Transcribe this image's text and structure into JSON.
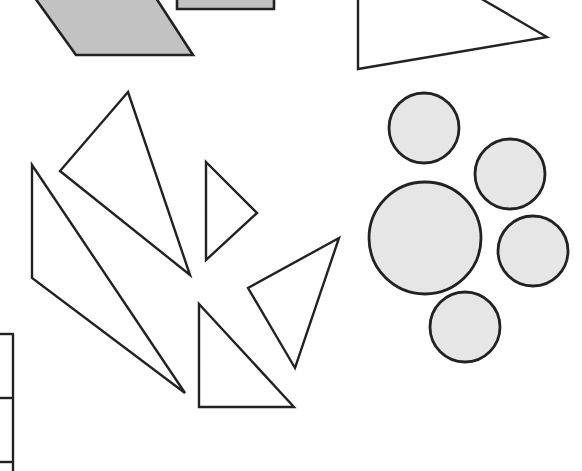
{
  "figure": {
    "colors": {
      "stroke": "#222222",
      "quad_fill": "#c2c2c2",
      "circle_fill": "#e6e6e6",
      "triangle_fill": "#ffffff",
      "background": "#ffffff"
    },
    "quadrilaterals": [
      {
        "name": "parallelogram",
        "points": "35,-2 156,-2 193,55 76,55",
        "fill": "#c2c2c2"
      },
      {
        "name": "rectangle",
        "points": "177,-2 274,-2 274,9 177,9",
        "fill": "#c2c2c2"
      }
    ],
    "triangles": [
      {
        "name": "triangle-top-right",
        "points": "358,-2 480,-2 547,37 358,69"
      },
      {
        "name": "triangle-tall-center",
        "points": "128,92 60,171 190,275"
      },
      {
        "name": "triangle-long-left",
        "points": "32,165 32,278 185,393"
      },
      {
        "name": "triangle-small-right-pointing",
        "points": "206,162 257,213 206,260"
      },
      {
        "name": "triangle-tilted",
        "points": "339,238 248,288 295,368"
      },
      {
        "name": "triangle-right-angle",
        "points": "199,304 199,407 294,407"
      }
    ],
    "circles": [
      {
        "name": "circle-top",
        "cx": 424,
        "cy": 128,
        "r": 35
      },
      {
        "name": "circle-upper-right",
        "cx": 510,
        "cy": 174,
        "r": 35
      },
      {
        "name": "circle-large",
        "cx": 425,
        "cy": 238,
        "r": 56
      },
      {
        "name": "circle-right",
        "cx": 533,
        "cy": 251,
        "r": 35
      },
      {
        "name": "circle-bottom",
        "cx": 465,
        "cy": 327,
        "r": 35
      }
    ],
    "left_boxes": {
      "vertical_x": 13,
      "horizontal_y": [
        334,
        398,
        462
      ]
    }
  }
}
